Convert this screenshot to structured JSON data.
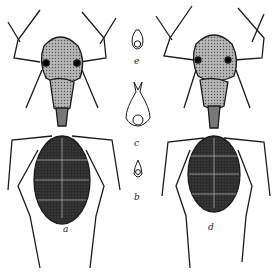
{
  "figure": {
    "labels": {
      "left_ant": "a",
      "right_ant": "d",
      "detail_top": "e",
      "detail_middle": "c",
      "detail_bottom": "b"
    },
    "colors": {
      "ink": "#1a1a1a",
      "gaster": "#2b2b2b",
      "head": "#8a8a8a",
      "background": "#ffffff"
    }
  }
}
